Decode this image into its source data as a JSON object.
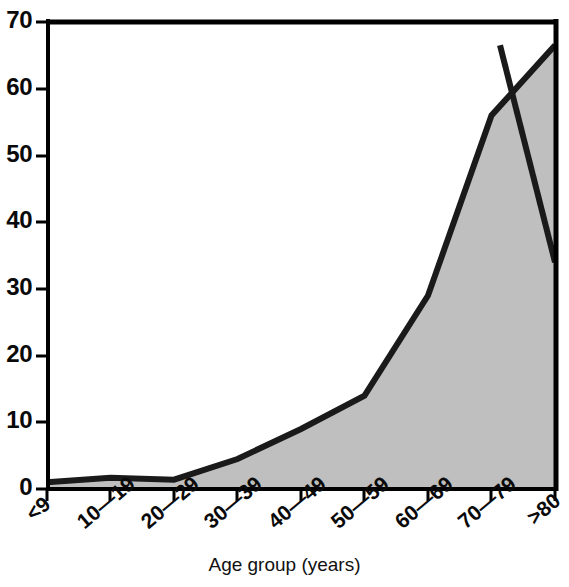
{
  "chart_data": {
    "type": "area",
    "title": "",
    "subtitle": "",
    "xlabel": "Age group (years)",
    "ylabel": "",
    "categories": [
      "<9",
      "10—19",
      "20—29",
      "30—39",
      "40—49",
      "50—59",
      "60—69",
      "70—79",
      ">80"
    ],
    "values": [
      1.0,
      1.7,
      1.4,
      4.5,
      9.0,
      14.0,
      29.0,
      56.0,
      66.5
    ],
    "end_drop_value": 34.0,
    "series": [
      {
        "name": "Cases",
        "values": [
          1.0,
          1.7,
          1.4,
          4.5,
          9.0,
          14.0,
          29.0,
          56.0,
          66.5
        ]
      }
    ],
    "ylim": [
      0,
      70
    ],
    "xlim": [
      0,
      8
    ],
    "ytick_values": [
      0,
      10,
      20,
      30,
      40,
      50,
      60,
      70
    ],
    "ytick_labels": [
      "0",
      "10",
      "20",
      "30",
      "40",
      "50",
      "60",
      "70"
    ],
    "grid": false,
    "legend": false,
    "legend_position": "none",
    "fill_color": "#bfbfbf",
    "line_color": "#1a1a1a",
    "axis_color": "#000000",
    "background_color": "#ffffff",
    "xtick_rotation_degrees": -40,
    "annotations": []
  },
  "axes": {
    "y": {
      "ticks": [
        {
          "label": "70",
          "value": 70
        },
        {
          "label": "60",
          "value": 60
        },
        {
          "label": "50",
          "value": 50
        },
        {
          "label": "40",
          "value": 40
        },
        {
          "label": "30",
          "value": 30
        },
        {
          "label": "20",
          "value": 20
        },
        {
          "label": "10",
          "value": 10
        },
        {
          "label": "0",
          "value": 0
        }
      ]
    },
    "x": {
      "title": "Age group (years)",
      "ticks": [
        {
          "label": "<9"
        },
        {
          "label": "10—19"
        },
        {
          "label": "20—29"
        },
        {
          "label": "30—39"
        },
        {
          "label": "40—49"
        },
        {
          "label": "50—59"
        },
        {
          "label": "60—69"
        },
        {
          "label": "70—79"
        },
        {
          "label": ">80"
        }
      ]
    }
  }
}
